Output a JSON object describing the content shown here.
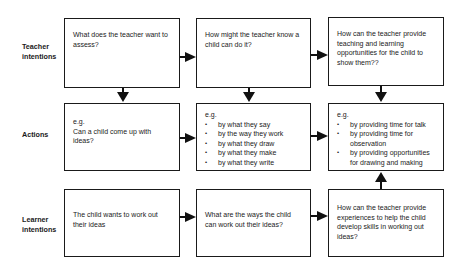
{
  "rows": [
    {
      "label_line1": "Teacher",
      "label_line2": "intentions"
    },
    {
      "label_line1": "Actions",
      "label_line2": ""
    },
    {
      "label_line1": "Learner",
      "label_line2": "intentions"
    }
  ],
  "boxes": {
    "teacher_1": {
      "text": "What does the teacher want to assess?"
    },
    "teacher_2": {
      "text": "How might the teacher know a child can do it?"
    },
    "teacher_3": {
      "text": "How can the teacher provide teaching and learning opportunities for the child to show them??"
    },
    "actions_1": {
      "eg": "e.g.",
      "text": "Can a child come up with ideas?"
    },
    "actions_2": {
      "eg": "e.g.",
      "items": [
        "by what they say",
        "by the way they work",
        "by what they draw",
        "by what they make",
        "by what they write"
      ]
    },
    "actions_3": {
      "eg": "e.g.",
      "items": [
        "by providing time for talk",
        "by providing time for observation",
        "by providing opportunities for drawing and making"
      ]
    },
    "learner_1": {
      "text": "The child wants to work out their ideas"
    },
    "learner_2": {
      "text": "What are the ways the child can work out their ideas?"
    },
    "learner_3": {
      "text": "How can the teacher provide experiences to help the child develop skills in working out ideas?"
    }
  },
  "arrows": [
    {
      "from": "teacher_1",
      "to": "teacher_2",
      "dir": "right"
    },
    {
      "from": "teacher_2",
      "to": "teacher_3",
      "dir": "right"
    },
    {
      "from": "teacher_1",
      "to": "actions_1",
      "dir": "down"
    },
    {
      "from": "teacher_2",
      "to": "actions_2",
      "dir": "down"
    },
    {
      "from": "teacher_3",
      "to": "actions_3",
      "dir": "down"
    },
    {
      "from": "actions_1",
      "to": "actions_2",
      "dir": "right"
    },
    {
      "from": "actions_2",
      "to": "actions_3",
      "dir": "right"
    },
    {
      "from": "learner_1",
      "to": "learner_2",
      "dir": "right"
    },
    {
      "from": "learner_2",
      "to": "learner_3",
      "dir": "right"
    },
    {
      "from": "learner_3",
      "to": "actions_3",
      "dir": "up"
    }
  ]
}
